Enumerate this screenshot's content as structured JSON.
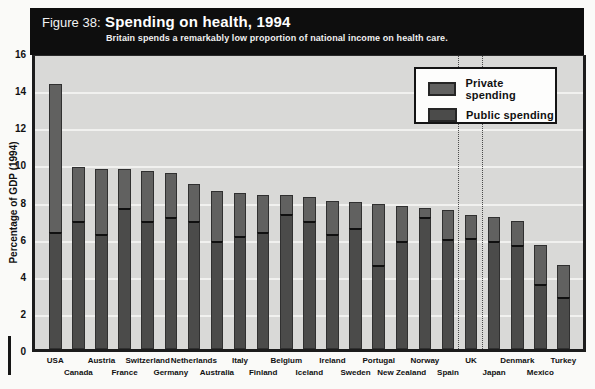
{
  "figure": {
    "label": "Figure 38:",
    "title": "Spending on health, 1994",
    "subtitle": "Britain spends a remarkably low proportion of national income on health care."
  },
  "legend": {
    "private_label": "Private spending",
    "public_label": "Public spending"
  },
  "y_axis": {
    "title": "Percentage of GDP (1994)",
    "ticks": [
      "0",
      "2",
      "4",
      "6",
      "8",
      "10",
      "12",
      "14",
      "16"
    ]
  },
  "colors": {
    "header_bg": "#0e0e0e",
    "plot_bg": "#d9d9d7",
    "gridline": "#f1f1ef",
    "private_fill": "#616160",
    "public_fill": "#4b4b4a",
    "split_line": "#101010"
  },
  "chart_data": {
    "type": "bar",
    "stacked": true,
    "title": "Spending on health, 1994",
    "subtitle": "Britain spends a remarkably low proportion of national income on health care.",
    "ylabel": "Percentage of GDP (1994)",
    "xlabel": "",
    "ylim": [
      0,
      16
    ],
    "grid": "horizontal gridlines every 2 units",
    "legend_position": "top-right",
    "highlight_category": "UK",
    "highlight_style": "vertical dotted lines bracketing the UK bar",
    "categories": [
      "USA",
      "Canada",
      "Austria",
      "France",
      "Switzerland",
      "Germany",
      "Netherlands",
      "Australia",
      "Italy",
      "Finland",
      "Belgium",
      "Iceland",
      "Ireland",
      "Sweden",
      "Portugal",
      "New Zealand",
      "Norway",
      "Spain",
      "UK",
      "Japan",
      "Denmark",
      "Mexico",
      "Turkey"
    ],
    "series": [
      {
        "name": "Public spending",
        "values": [
          6.3,
          6.9,
          6.2,
          7.6,
          6.9,
          7.1,
          6.9,
          5.8,
          6.1,
          6.3,
          7.3,
          6.9,
          6.2,
          6.5,
          4.5,
          5.8,
          7.1,
          5.9,
          6.0,
          5.8,
          5.6,
          3.5,
          2.8
        ]
      },
      {
        "name": "Private spending",
        "values": [
          8.0,
          2.9,
          3.5,
          2.1,
          2.7,
          2.4,
          2.0,
          2.7,
          2.3,
          2.0,
          1.0,
          1.3,
          1.8,
          1.4,
          3.3,
          1.9,
          0.5,
          1.6,
          1.2,
          1.3,
          1.3,
          2.1,
          1.7
        ]
      }
    ],
    "totals": [
      14.3,
      9.8,
      9.7,
      9.7,
      9.6,
      9.5,
      8.9,
      8.5,
      8.4,
      8.3,
      8.3,
      8.2,
      8.0,
      7.9,
      7.8,
      7.7,
      7.6,
      7.5,
      7.2,
      7.1,
      6.9,
      5.6,
      4.5
    ]
  }
}
